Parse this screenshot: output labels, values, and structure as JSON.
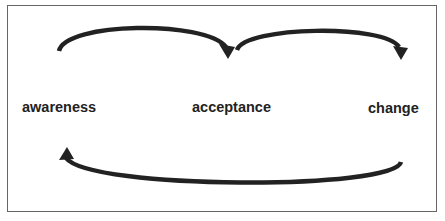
{
  "diagram": {
    "nodes": [
      {
        "id": "awareness",
        "label": "awareness"
      },
      {
        "id": "acceptance",
        "label": "acceptance"
      },
      {
        "id": "change",
        "label": "change"
      }
    ],
    "edges": [
      {
        "from": "awareness",
        "to": "acceptance",
        "direction": "forward"
      },
      {
        "from": "acceptance",
        "to": "change",
        "direction": "forward"
      },
      {
        "from": "change",
        "to": "awareness",
        "direction": "backward"
      }
    ],
    "colors": {
      "stroke": "#222222",
      "border": "#666666",
      "background": "#ffffff"
    }
  }
}
